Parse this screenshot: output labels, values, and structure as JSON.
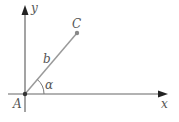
{
  "diagram": {
    "type": "coordinate-vector",
    "axes": {
      "x_label": "x",
      "y_label": "y"
    },
    "points": {
      "origin": {
        "label": "A"
      },
      "end": {
        "label": "C"
      }
    },
    "segment": {
      "label": "b",
      "from": "A",
      "to": "C"
    },
    "angle": {
      "label": "α",
      "between": [
        "x-axis",
        "AC"
      ]
    },
    "colors": {
      "axis": "#555555",
      "segment": "#9a9a9a",
      "point": "#888888",
      "text": "#555555"
    }
  }
}
